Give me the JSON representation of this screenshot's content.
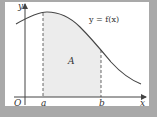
{
  "figure": {
    "type": "area-under-curve",
    "curve_label": "y = f(x)",
    "region_label": "A",
    "origin_label": "O",
    "x_axis_label": "x",
    "y_axis_label": "y",
    "bounds": {
      "lower": "a",
      "upper": "b"
    }
  },
  "colors": {
    "frame": "#a9a9a9",
    "panel": "#ffffff",
    "shade": "#ececec",
    "line": "#444444"
  }
}
